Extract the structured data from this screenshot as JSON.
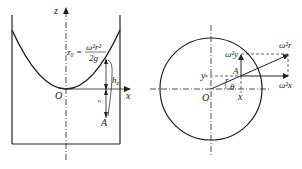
{
  "left_figure": {
    "axis_z": "z",
    "axis_x": "x",
    "origin": "O",
    "formula_lhs": "z₀ =",
    "formula_num": "ω²r²",
    "formula_den": "2g",
    "label_h": "h",
    "label_h_sub": "z",
    "label_z": "z",
    "point": "A"
  },
  "right_figure": {
    "origin": "O",
    "label_y": "y",
    "label_x": "x",
    "label_r": "r",
    "label_theta": "θ",
    "point": "A",
    "vec_w2y": "ω²y",
    "vec_w2r": "ω²r",
    "vec_w2x": "ω²x"
  }
}
